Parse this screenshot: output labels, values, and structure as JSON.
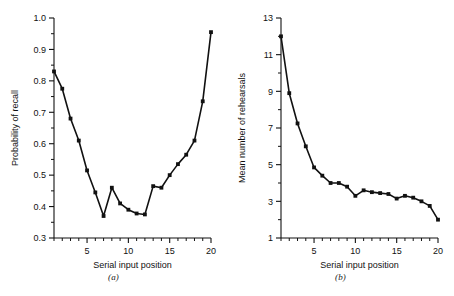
{
  "figure": {
    "background_color": "#ffffff",
    "ink_color": "#111111",
    "panels": [
      {
        "caption": "(a)"
      },
      {
        "caption": "(b)"
      }
    ]
  },
  "chart_data": [
    {
      "type": "line",
      "panel_label": "(a)",
      "title": "",
      "xlabel": "Serial input position",
      "ylabel": "Probability of recall",
      "xlim": [
        1,
        20
      ],
      "ylim": [
        0.3,
        1.0
      ],
      "grid": false,
      "legend": null,
      "marker": "filled-square",
      "x_major_ticks": [
        5,
        10,
        15,
        20
      ],
      "x_tick_labels": [
        "5",
        "10",
        "15",
        "20"
      ],
      "x_minor_ticks": [
        1,
        2,
        3,
        4,
        6,
        7,
        8,
        9,
        11,
        12,
        13,
        14,
        16,
        17,
        18,
        19
      ],
      "y_major_ticks": [
        0.3,
        0.4,
        0.5,
        0.6,
        0.7,
        0.8,
        0.9,
        1.0
      ],
      "y_tick_labels": [
        "0.3",
        "0.4",
        "0.5",
        "0.6",
        "0.7",
        "0.8",
        "0.9",
        "1.0"
      ],
      "y_minor_ticks": [
        0.35,
        0.45,
        0.55,
        0.65,
        0.75,
        0.85,
        0.95
      ],
      "x": [
        1,
        2,
        3,
        4,
        5,
        6,
        7,
        8,
        9,
        10,
        11,
        12,
        13,
        14,
        15,
        16,
        17,
        18,
        19,
        20
      ],
      "values": [
        0.83,
        0.775,
        0.68,
        0.61,
        0.515,
        0.445,
        0.37,
        0.46,
        0.41,
        0.39,
        0.378,
        0.375,
        0.465,
        0.46,
        0.5,
        0.535,
        0.565,
        0.61,
        0.735,
        0.955
      ]
    },
    {
      "type": "line",
      "panel_label": "(b)",
      "title": "",
      "xlabel": "Serial input position",
      "ylabel": "Mean number of rehearsals",
      "xlim": [
        1,
        20
      ],
      "ylim": [
        1,
        13
      ],
      "grid": false,
      "legend": null,
      "marker": "filled-square",
      "x_major_ticks": [
        5,
        10,
        15,
        20
      ],
      "x_tick_labels": [
        "5",
        "10",
        "15",
        "20"
      ],
      "x_minor_ticks": [
        1,
        2,
        3,
        4,
        6,
        7,
        8,
        9,
        11,
        12,
        13,
        14,
        16,
        17,
        18,
        19
      ],
      "y_major_ticks": [
        1,
        3,
        5,
        7,
        9,
        11,
        13
      ],
      "y_tick_labels": [
        "1",
        "3",
        "5",
        "7",
        "9",
        "11",
        "13"
      ],
      "y_minor_ticks": [
        2,
        4,
        6,
        8,
        10,
        12
      ],
      "x": [
        1,
        2,
        3,
        4,
        5,
        6,
        7,
        8,
        9,
        10,
        11,
        12,
        13,
        14,
        15,
        16,
        17,
        18,
        19,
        20
      ],
      "values": [
        12.0,
        8.9,
        7.25,
        6.0,
        4.85,
        4.4,
        4.0,
        4.0,
        3.8,
        3.3,
        3.6,
        3.5,
        3.45,
        3.4,
        3.15,
        3.3,
        3.2,
        3.0,
        2.75,
        2.0
      ]
    }
  ]
}
